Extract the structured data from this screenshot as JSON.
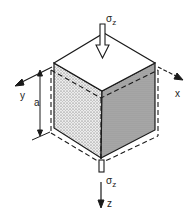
{
  "diagram": {
    "labels": {
      "sigma_top": "σ",
      "sigma_top_sub": "z",
      "sigma_bottom": "σ",
      "sigma_bottom_sub": "z",
      "axis_x": "x",
      "axis_y": "y",
      "axis_z": "z",
      "dimension_a": "a"
    },
    "colors": {
      "line": "#1a1a1a",
      "top_face": "#ffffff",
      "left_face": "#d9d9d9",
      "right_face": "#a9a9a9"
    }
  }
}
